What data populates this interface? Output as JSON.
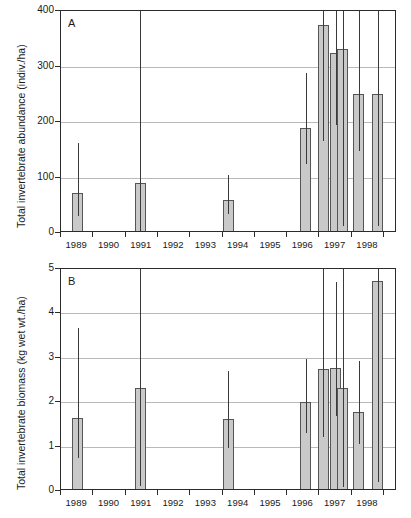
{
  "figure": {
    "background": "#ffffff",
    "bar_fill": "#c9c9c9",
    "bar_stroke": "#555555",
    "axis_color": "#2b2b2b",
    "grid_color": "#b9b9b9"
  },
  "chart_data": [
    {
      "type": "bar",
      "panel_letter": "A",
      "title": "",
      "xlabel": "",
      "ylabel": "Total invertebrate abundance (indiv./ha)",
      "ylim": [
        0,
        400
      ],
      "yticks": [
        0,
        100,
        200,
        300,
        400
      ],
      "ytick_labels": [
        "0",
        "100",
        "200",
        "300",
        "400"
      ],
      "grid": true,
      "xlim": [
        1988.5,
        1998.9
      ],
      "xticks": [
        1988.5,
        1989.5,
        1990.5,
        1991.5,
        1992.5,
        1993.5,
        1994.5,
        1995.5,
        1996.5,
        1997.5,
        1998.5
      ],
      "xtick_labels": [
        "1989",
        "1990",
        "1991",
        "1992",
        "1993",
        "1994",
        "1995",
        "1996",
        "1997",
        "1998"
      ],
      "bars": [
        {
          "label": "1989",
          "x": 1989.02,
          "value": 72,
          "err_low": 30,
          "err_high": 163
        },
        {
          "label": "1991",
          "x": 1990.95,
          "value": 90,
          "err_low": 0,
          "err_high": 400
        },
        {
          "label": "1994",
          "x": 1993.68,
          "value": 60,
          "err_low": 35,
          "err_high": 105
        },
        {
          "label": "1996",
          "x": 1996.08,
          "value": 190,
          "err_low": 125,
          "err_high": 288
        },
        {
          "label": "1996b",
          "x": 1996.62,
          "value": 375,
          "err_low": 165,
          "err_high": 400
        },
        {
          "label": "1997a",
          "x": 1997.0,
          "value": 325,
          "err_low": 195,
          "err_high": 400
        },
        {
          "label": "1997b",
          "x": 1997.22,
          "value": 332,
          "err_low": 12,
          "err_high": 400
        },
        {
          "label": "1997c",
          "x": 1997.72,
          "value": 250,
          "err_low": 147,
          "err_high": 400
        },
        {
          "label": "1998",
          "x": 1998.3,
          "value": 250,
          "err_low": 12,
          "err_high": 400
        }
      ]
    },
    {
      "type": "bar",
      "panel_letter": "B",
      "title": "",
      "xlabel": "",
      "ylabel": "Total invertebrate biomass (kg wet wt./ha)",
      "ylim": [
        0,
        5
      ],
      "yticks": [
        0,
        1,
        2,
        3,
        4,
        5
      ],
      "ytick_labels": [
        "0",
        "1",
        "2",
        "3",
        "4",
        "5"
      ],
      "grid": true,
      "xlim": [
        1988.5,
        1998.9
      ],
      "xticks": [
        1988.5,
        1989.5,
        1990.5,
        1991.5,
        1992.5,
        1993.5,
        1994.5,
        1995.5,
        1996.5,
        1997.5,
        1998.5
      ],
      "xtick_labels": [
        "1989",
        "1990",
        "1991",
        "1992",
        "1993",
        "1994",
        "1995",
        "1996",
        "1997",
        "1998"
      ],
      "bars": [
        {
          "label": "1989",
          "x": 1989.02,
          "value": 1.65,
          "err_low": 0.75,
          "err_high": 3.67
        },
        {
          "label": "1991",
          "x": 1990.95,
          "value": 2.32,
          "err_low": 0.12,
          "err_high": 5.0
        },
        {
          "label": "1994",
          "x": 1993.68,
          "value": 1.62,
          "err_low": 0.97,
          "err_high": 2.7
        },
        {
          "label": "1996",
          "x": 1996.08,
          "value": 2.0,
          "err_low": 1.3,
          "err_high": 2.98
        },
        {
          "label": "1996b",
          "x": 1996.62,
          "value": 2.75,
          "err_low": 1.21,
          "err_high": 5.0
        },
        {
          "label": "1997a",
          "x": 1997.0,
          "value": 2.78,
          "err_low": 1.68,
          "err_high": 4.71
        },
        {
          "label": "1997b",
          "x": 1997.22,
          "value": 2.33,
          "err_low": 0.09,
          "err_high": 5.0
        },
        {
          "label": "1997c",
          "x": 1997.72,
          "value": 1.77,
          "err_low": 1.05,
          "err_high": 2.92
        },
        {
          "label": "1998",
          "x": 1998.3,
          "value": 4.73,
          "err_low": 0.2,
          "err_high": 5.0
        }
      ]
    }
  ]
}
